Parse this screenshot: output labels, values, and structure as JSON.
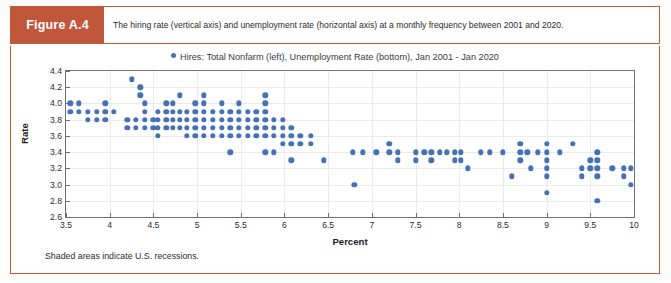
{
  "figure": {
    "tag": "Figure A.4",
    "caption": "The hiring rate (vertical axis) and unemployment rate (horizontal axis) at a monthly frequency between 2001 and 2020.",
    "footnote": "Shaded areas indicate U.S. recessions.",
    "accent_color": "#c0573c",
    "border_color": "#c35a3c"
  },
  "chart_data": {
    "type": "scatter",
    "title": "",
    "legend": [
      {
        "label": "Hires: Total Nonfarm (left), Unemployment Rate (bottom), Jan 2001 - Jan 2020",
        "color": "#4472b4",
        "marker": "circle"
      }
    ],
    "legend_position": "top-center",
    "grid": true,
    "xlabel": "Percent",
    "ylabel": "Rate",
    "xlim": [
      3.5,
      10
    ],
    "ylim": [
      2.6,
      4.4
    ],
    "xticks": [
      3.5,
      4,
      4.5,
      5,
      5.5,
      6,
      6.5,
      7,
      7.5,
      8,
      8.5,
      9,
      9.5,
      10
    ],
    "xtick_labels": [
      "3.5",
      "4",
      "4.5",
      "5",
      "5.5",
      "6",
      "6.5",
      "7",
      "7.5",
      "8",
      "8.5",
      "9",
      "9.5",
      "10"
    ],
    "yticks": [
      2.6,
      2.8,
      3.0,
      3.2,
      3.4,
      3.6,
      3.8,
      4.0,
      4.2,
      4.4
    ],
    "ytick_labels": [
      "2.6",
      "2.8",
      "3.0",
      "3.2",
      "3.4",
      "3.6",
      "3.8",
      "4.0",
      "4.2",
      "4.4"
    ],
    "series": [
      {
        "name": "Hires: Total Nonfarm (left), Unemployment Rate (bottom), Jan 2001 - Jan 2020",
        "color": "#4472b4",
        "points": [
          [
            3.55,
            4.0
          ],
          [
            3.55,
            3.9
          ],
          [
            3.65,
            4.0
          ],
          [
            3.65,
            3.9
          ],
          [
            3.75,
            3.9
          ],
          [
            3.75,
            3.8
          ],
          [
            3.85,
            3.9
          ],
          [
            3.85,
            3.8
          ],
          [
            3.95,
            4.0
          ],
          [
            3.95,
            3.9
          ],
          [
            3.95,
            3.8
          ],
          [
            4.05,
            3.9
          ],
          [
            4.2,
            3.8
          ],
          [
            4.2,
            3.7
          ],
          [
            4.3,
            3.8
          ],
          [
            4.3,
            3.7
          ],
          [
            4.25,
            4.3
          ],
          [
            4.35,
            4.2
          ],
          [
            4.35,
            4.1
          ],
          [
            4.4,
            4.0
          ],
          [
            4.4,
            3.9
          ],
          [
            4.4,
            3.8
          ],
          [
            4.4,
            3.7
          ],
          [
            4.5,
            3.8
          ],
          [
            4.5,
            3.7
          ],
          [
            4.55,
            3.9
          ],
          [
            4.55,
            3.8
          ],
          [
            4.55,
            3.7
          ],
          [
            4.55,
            3.6
          ],
          [
            4.65,
            4.0
          ],
          [
            4.65,
            3.9
          ],
          [
            4.65,
            3.8
          ],
          [
            4.65,
            3.7
          ],
          [
            4.72,
            4.0
          ],
          [
            4.72,
            3.9
          ],
          [
            4.72,
            3.8
          ],
          [
            4.72,
            3.7
          ],
          [
            4.8,
            4.1
          ],
          [
            4.8,
            3.9
          ],
          [
            4.8,
            3.8
          ],
          [
            4.8,
            3.7
          ],
          [
            4.88,
            3.9
          ],
          [
            4.88,
            3.8
          ],
          [
            4.88,
            3.7
          ],
          [
            4.88,
            3.6
          ],
          [
            4.98,
            4.0
          ],
          [
            4.98,
            3.9
          ],
          [
            4.98,
            3.8
          ],
          [
            4.98,
            3.7
          ],
          [
            4.98,
            3.6
          ],
          [
            5.08,
            4.1
          ],
          [
            5.08,
            4.0
          ],
          [
            5.08,
            3.9
          ],
          [
            5.08,
            3.8
          ],
          [
            5.08,
            3.7
          ],
          [
            5.08,
            3.6
          ],
          [
            5.18,
            3.9
          ],
          [
            5.18,
            3.8
          ],
          [
            5.18,
            3.7
          ],
          [
            5.18,
            3.6
          ],
          [
            5.28,
            4.0
          ],
          [
            5.28,
            3.9
          ],
          [
            5.28,
            3.8
          ],
          [
            5.28,
            3.7
          ],
          [
            5.28,
            3.6
          ],
          [
            5.38,
            3.9
          ],
          [
            5.38,
            3.8
          ],
          [
            5.38,
            3.7
          ],
          [
            5.38,
            3.6
          ],
          [
            5.38,
            3.4
          ],
          [
            5.48,
            4.0
          ],
          [
            5.48,
            3.9
          ],
          [
            5.48,
            3.8
          ],
          [
            5.48,
            3.7
          ],
          [
            5.48,
            3.6
          ],
          [
            5.58,
            3.9
          ],
          [
            5.58,
            3.8
          ],
          [
            5.58,
            3.7
          ],
          [
            5.58,
            3.6
          ],
          [
            5.68,
            3.9
          ],
          [
            5.68,
            3.8
          ],
          [
            5.68,
            3.7
          ],
          [
            5.68,
            3.6
          ],
          [
            5.78,
            4.1
          ],
          [
            5.78,
            4.0
          ],
          [
            5.78,
            3.9
          ],
          [
            5.78,
            3.8
          ],
          [
            5.78,
            3.7
          ],
          [
            5.78,
            3.6
          ],
          [
            5.78,
            3.4
          ],
          [
            5.88,
            3.8
          ],
          [
            5.88,
            3.7
          ],
          [
            5.88,
            3.6
          ],
          [
            5.88,
            3.4
          ],
          [
            5.98,
            3.8
          ],
          [
            5.98,
            3.7
          ],
          [
            5.98,
            3.6
          ],
          [
            5.98,
            3.5
          ],
          [
            6.08,
            3.7
          ],
          [
            6.08,
            3.6
          ],
          [
            6.08,
            3.5
          ],
          [
            6.08,
            3.3
          ],
          [
            6.18,
            3.6
          ],
          [
            6.18,
            3.5
          ],
          [
            6.3,
            3.6
          ],
          [
            6.3,
            3.5
          ],
          [
            6.45,
            3.3
          ],
          [
            6.8,
            3.0
          ],
          [
            6.78,
            3.4
          ],
          [
            6.9,
            3.4
          ],
          [
            7.05,
            3.4
          ],
          [
            7.2,
            3.5
          ],
          [
            7.2,
            3.4
          ],
          [
            7.3,
            3.4
          ],
          [
            7.3,
            3.3
          ],
          [
            7.5,
            3.4
          ],
          [
            7.5,
            3.3
          ],
          [
            7.6,
            3.4
          ],
          [
            7.68,
            3.4
          ],
          [
            7.68,
            3.3
          ],
          [
            7.78,
            3.4
          ],
          [
            7.86,
            3.4
          ],
          [
            7.95,
            3.4
          ],
          [
            7.95,
            3.3
          ],
          [
            8.02,
            3.4
          ],
          [
            8.02,
            3.3
          ],
          [
            8.1,
            3.2
          ],
          [
            8.25,
            3.4
          ],
          [
            8.35,
            3.4
          ],
          [
            8.5,
            3.4
          ],
          [
            8.6,
            3.1
          ],
          [
            8.7,
            3.5
          ],
          [
            8.7,
            3.4
          ],
          [
            8.7,
            3.3
          ],
          [
            8.78,
            3.4
          ],
          [
            8.82,
            3.2
          ],
          [
            8.9,
            3.4
          ],
          [
            9.0,
            3.5
          ],
          [
            9.0,
            3.4
          ],
          [
            9.0,
            3.3
          ],
          [
            9.0,
            3.2
          ],
          [
            9.0,
            3.1
          ],
          [
            9.0,
            2.9
          ],
          [
            9.15,
            3.4
          ],
          [
            9.3,
            3.5
          ],
          [
            9.4,
            3.2
          ],
          [
            9.4,
            3.1
          ],
          [
            9.5,
            3.3
          ],
          [
            9.5,
            3.2
          ],
          [
            9.58,
            3.4
          ],
          [
            9.58,
            3.3
          ],
          [
            9.58,
            3.2
          ],
          [
            9.58,
            3.1
          ],
          [
            9.58,
            2.8
          ],
          [
            9.75,
            3.2
          ],
          [
            9.88,
            3.2
          ],
          [
            9.88,
            3.1
          ],
          [
            9.96,
            3.2
          ],
          [
            9.96,
            3.0
          ]
        ]
      }
    ]
  }
}
